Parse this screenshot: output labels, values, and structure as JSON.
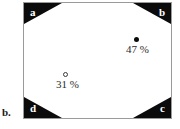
{
  "figure": {
    "panel_label": "b.",
    "box": {
      "corners": [
        {
          "id": "a",
          "label": "a",
          "position": "top-left"
        },
        {
          "id": "b",
          "label": "b",
          "position": "top-right"
        },
        {
          "id": "c",
          "label": "c",
          "position": "bottom-right"
        },
        {
          "id": "d",
          "label": "d",
          "position": "bottom-left"
        }
      ]
    },
    "datapoints": [
      {
        "id": "point-47",
        "marker": "filled-circle",
        "label": "47 %",
        "value": 47,
        "unit": "%"
      },
      {
        "id": "point-31",
        "marker": "open-circle",
        "label": "31 %",
        "value": 31,
        "unit": "%"
      }
    ]
  },
  "colors": {
    "corner_fill": "#0b0b0b",
    "corner_text": "#ffffff",
    "frame": "#9a9a9a",
    "background": "#ffffff",
    "label_text": "#2b2b2b"
  }
}
